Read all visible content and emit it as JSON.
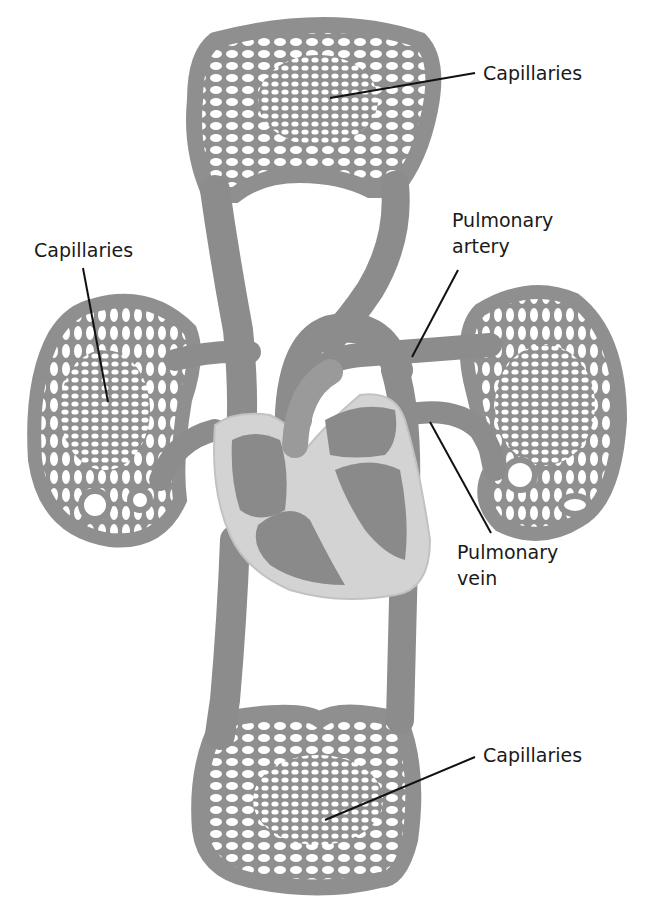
{
  "diagram": {
    "colors": {
      "vessel": "#8f8f8f",
      "vessel_dark": "#7a7a7a",
      "heart_wall": "#d2d2d2",
      "chamber": "#8a8a8a",
      "leader_line": "#111111",
      "background": "#ffffff"
    },
    "labels": {
      "capillaries_top": "Capillaries",
      "capillaries_left": "Capillaries",
      "pulmonary_artery_line1": "Pulmonary",
      "pulmonary_artery_line2": "artery",
      "pulmonary_vein_line1": "Pulmonary",
      "pulmonary_vein_line2": "vein",
      "capillaries_bottom": "Capillaries"
    },
    "nodes": [
      {
        "id": "heart",
        "label": ""
      },
      {
        "id": "upper-capillary-bed",
        "label": "Capillaries"
      },
      {
        "id": "left-lung-capillary-bed",
        "label": "Capillaries"
      },
      {
        "id": "right-lung-capillary-bed",
        "label": ""
      },
      {
        "id": "lower-capillary-bed",
        "label": "Capillaries"
      },
      {
        "id": "pulmonary-artery",
        "label": "Pulmonary artery"
      },
      {
        "id": "pulmonary-vein",
        "label": "Pulmonary vein"
      }
    ],
    "edges": [
      {
        "from": "heart",
        "to": "upper-capillary-bed"
      },
      {
        "from": "upper-capillary-bed",
        "to": "heart"
      },
      {
        "from": "heart",
        "to": "left-lung-capillary-bed"
      },
      {
        "from": "heart",
        "to": "right-lung-capillary-bed",
        "via": "pulmonary-artery"
      },
      {
        "from": "right-lung-capillary-bed",
        "to": "heart",
        "via": "pulmonary-vein"
      },
      {
        "from": "heart",
        "to": "lower-capillary-bed"
      },
      {
        "from": "lower-capillary-bed",
        "to": "heart"
      }
    ]
  }
}
